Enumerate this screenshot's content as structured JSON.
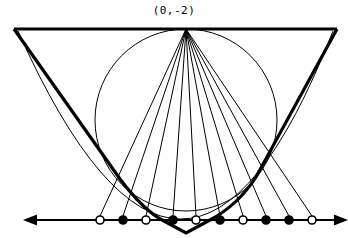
{
  "figure": {
    "title_label": "(0,-2)",
    "type": "geometric-construction",
    "stroke_color": "#000000",
    "background_color": "#ffffff",
    "thin_stroke_width": 1,
    "thick_stroke_width": 3.2,
    "axis_stroke_width": 2.2
  },
  "chart_data": {
    "type": "scatter",
    "title": "(0,-2)",
    "xlabel": "",
    "ylabel": "",
    "grid": false,
    "legend": null,
    "axis": {
      "y_pixel": 220,
      "x_start_pixel": 33,
      "x_end_pixel": 340,
      "left_arrow": true,
      "right_arrow": true
    },
    "focus_point": {
      "label": "(0,-2)",
      "x": 186,
      "y": 29
    },
    "circle": {
      "center_x": 186,
      "center_y": 120,
      "radius": 91
    },
    "v_curve": {
      "description": "thick V / parabola through axis",
      "left_top_x": 14,
      "left_top_y": 29,
      "vertex_x": 186,
      "vertex_y": 233,
      "right_top_x": 337,
      "right_top_y": 29
    },
    "thin_curve": {
      "description": "thin parabolic arc tangent to the V",
      "vertex_x": 186,
      "vertex_y": 219
    },
    "top_line": {
      "x1": 14,
      "x2": 337,
      "y": 29
    },
    "points": [
      {
        "x": 100,
        "y": 220,
        "fill": "open",
        "ray_to_focus": true
      },
      {
        "x": 123,
        "y": 220,
        "fill": "filled",
        "ray_to_focus": true
      },
      {
        "x": 146,
        "y": 220,
        "fill": "open",
        "ray_to_focus": true
      },
      {
        "x": 173,
        "y": 220,
        "fill": "filled",
        "ray_to_focus": true
      },
      {
        "x": 196,
        "y": 220,
        "fill": "open",
        "ray_to_focus": true
      },
      {
        "x": 220,
        "y": 220,
        "fill": "filled",
        "ray_to_focus": true
      },
      {
        "x": 243,
        "y": 220,
        "fill": "open",
        "ray_to_focus": true
      },
      {
        "x": 266,
        "y": 220,
        "fill": "filled",
        "ray_to_focus": true
      },
      {
        "x": 289,
        "y": 220,
        "fill": "filled",
        "ray_to_focus": true
      },
      {
        "x": 312,
        "y": 220,
        "fill": "open",
        "ray_to_focus": true
      }
    ],
    "point_radius": 4,
    "marker_legend": {
      "open": "hollow circle marker",
      "filled": "solid circle marker"
    }
  }
}
